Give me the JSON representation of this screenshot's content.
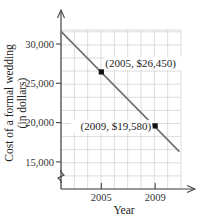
{
  "chart_data": {
    "type": "line",
    "title": "",
    "xlabel": "Year",
    "ylabel": "Cost of a formal wedding (in dollars)",
    "ylabel_lines": [
      "Cost of a formal wedding",
      "(in dollars)"
    ],
    "x_ticks": [
      2005,
      2009
    ],
    "x_tick_labels": [
      "2005",
      "2009"
    ],
    "y_ticks": [
      15000,
      20000,
      25000,
      30000
    ],
    "y_tick_labels": [
      "15,000",
      "20,000",
      "25,000",
      "30,000"
    ],
    "xlim": [
      2002,
      2010.8
    ],
    "ylim": [
      12500,
      31800
    ],
    "grid": true,
    "y_axis_break": true,
    "series": [
      {
        "name": "Cost of a formal wedding",
        "color": "#6e6e6e",
        "x": [
          2002,
          2010.8
        ],
        "y": [
          31600,
          16300
        ]
      }
    ],
    "points": [
      {
        "x": 2005,
        "y": 26450,
        "label": "(2005, $26,450)"
      },
      {
        "x": 2009,
        "y": 19580,
        "label": "(2009, $19,580)"
      }
    ],
    "colors": {
      "grid": "#d4d4d4",
      "axis": "#444444",
      "line": "#6e6e6e",
      "point": "#111111"
    }
  }
}
